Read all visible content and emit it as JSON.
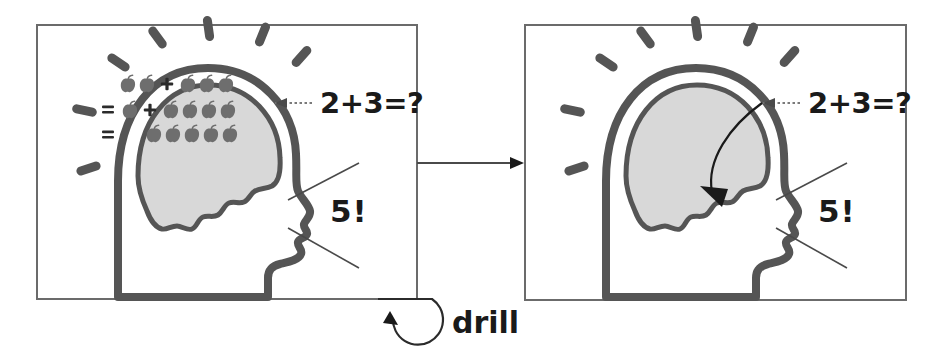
{
  "figure": {
    "background_color": "#ffffff",
    "width": 943,
    "height": 355
  },
  "panels": [
    {
      "id": "panel-before",
      "frame": {
        "x": 37,
        "y": 25,
        "width": 380,
        "height": 274
      },
      "border_color": "#6b6b6b",
      "head": {
        "outline_color": "#555555",
        "brain_fill": "#d8d8d8",
        "brain_state": "working",
        "rays_count": 7,
        "ray_color": "#555555"
      },
      "brain_contents": {
        "description": "apple arithmetic being computed inside the brain",
        "rows": [
          {
            "equals_sign": false,
            "groups": [
              2,
              3
            ],
            "operator": "+"
          },
          {
            "equals_sign": true,
            "groups": [
              1,
              4
            ],
            "operator": "+"
          },
          {
            "equals_sign": true,
            "groups": [
              5
            ],
            "operator": ""
          }
        ],
        "apple_color": "#6e6e6e",
        "symbol_color": "#2b2b2b"
      },
      "input_label": "2+3=?",
      "output_label": "5!",
      "input_arrow": {
        "style": "dotted",
        "direction": "left",
        "color": "#7a7a7a"
      },
      "speech_lines": 2
    },
    {
      "id": "panel-after",
      "frame": {
        "x": 525,
        "y": 25,
        "width": 381,
        "height": 275
      },
      "border_color": "#6b6b6b",
      "head": {
        "outline_color": "#555555",
        "brain_fill": "#d8d8d8",
        "brain_state": "empty",
        "rays_count": 7,
        "ray_color": "#555555"
      },
      "brain_contents": {
        "description": "brain is empty; answer is recalled directly",
        "rows": [],
        "apple_color": "#6e6e6e",
        "symbol_color": "#2b2b2b"
      },
      "input_label": "2+3=?",
      "output_label": "5!",
      "input_arrow": {
        "style": "dotted",
        "direction": "left",
        "color": "#7a7a7a"
      },
      "bypass_arrow": {
        "label": "",
        "description": "curved arrow from input point directly to the mouth, bypassing the brain",
        "color": "#1a1a1a"
      },
      "speech_lines": 2
    }
  ],
  "connectors": {
    "panel_transition": {
      "style": "solid",
      "direction": "right",
      "color": "#4a4a4a",
      "from_panel": "panel-before",
      "to_panel": "panel-after"
    },
    "drill_loop": {
      "label": "drill",
      "style": "circular-loop",
      "direction": "counter-clockwise",
      "color": "#2b2b2b"
    }
  }
}
